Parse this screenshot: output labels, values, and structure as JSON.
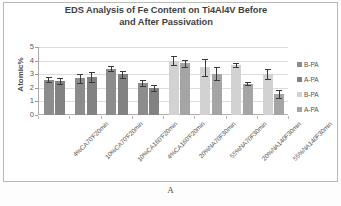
{
  "figure": {
    "caption": "A"
  },
  "chart_data": {
    "type": "bar",
    "title": "EDS Analysis of Fe Content on Ti4Al4V Before and After Passivation",
    "title_line1": "EDS Analysis of Fe Content on Ti4Al4V Before",
    "title_line2": "and After Passivation",
    "xlabel": "",
    "ylabel": "Atomic%",
    "ylim": [
      0,
      5
    ],
    "yticks": [
      0,
      1,
      2,
      3,
      4,
      5
    ],
    "ytick_labels": [
      "0",
      "1",
      "2",
      "3",
      "4",
      "5"
    ],
    "grid": true,
    "legend_position": "right",
    "categories": [
      "4%CA70'F20min",
      "10%CA70'F20min",
      "10%CA160'F20min",
      "4%CA160'F20min",
      "20%NA70F30min",
      "55%NA70F30min",
      "20%NA140F30min",
      "55%NA140F30min"
    ],
    "series": [
      {
        "name": "B-PA",
        "legend_label": "B-PA",
        "color": "#8c8c8c",
        "group_span": [
          0,
          1,
          2,
          3
        ],
        "values": [
          2.6,
          2.7,
          3.4,
          2.35,
          null,
          null,
          null,
          null
        ],
        "errors": [
          0.2,
          0.35,
          0.2,
          0.25,
          null,
          null,
          null,
          null
        ]
      },
      {
        "name": "A-PA",
        "legend_label": "A-PA",
        "color": "#828282",
        "group_span": [
          0,
          1,
          2,
          3
        ],
        "values": [
          2.5,
          2.8,
          3.0,
          2.0,
          null,
          null,
          null,
          null
        ],
        "errors": [
          0.2,
          0.35,
          0.25,
          0.2,
          null,
          null,
          null,
          null
        ]
      },
      {
        "name": "B-PA-2",
        "legend_label": "B-PA",
        "color": "#d2d2d2",
        "group_span": [
          4,
          5,
          6,
          7
        ],
        "values": [
          null,
          null,
          null,
          null,
          4.0,
          3.5,
          3.65,
          3.0
        ],
        "errors": [
          null,
          null,
          null,
          null,
          0.35,
          0.6,
          0.15,
          0.35
        ]
      },
      {
        "name": "A-PA-2",
        "legend_label": "A-PA",
        "color": "#a5a5a5",
        "group_span": [
          4,
          5,
          6,
          7
        ],
        "values": [
          null,
          null,
          null,
          null,
          3.8,
          3.05,
          2.3,
          1.55
        ],
        "errors": [
          null,
          null,
          null,
          null,
          0.25,
          0.45,
          0.12,
          0.28
        ]
      }
    ],
    "legend": [
      {
        "label": "B-PA",
        "color": "#8c8c8c"
      },
      {
        "label": "A-PA",
        "color": "#828282"
      },
      {
        "label": "B-PA",
        "color": "#d2d2d2"
      },
      {
        "label": "A-PA",
        "color": "#a5a5a5"
      }
    ]
  }
}
